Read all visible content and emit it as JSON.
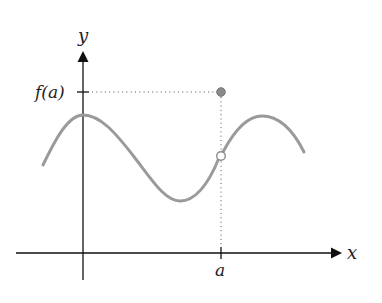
{
  "figure": {
    "axes": {
      "x_label": "x",
      "y_label": "y"
    },
    "ticks": {
      "x_tick_label": "a",
      "y_tick_label": "f(a)"
    },
    "colors": {
      "axis": "#111111",
      "curve": "#9a9a9a",
      "guide": "#555555",
      "point_filled": "#8a8a8a",
      "point_open_fill": "#ffffff"
    },
    "points": {
      "filled_point": "f(a) at x = a",
      "open_point": "limit value of curve at x = a (hole)"
    }
  }
}
